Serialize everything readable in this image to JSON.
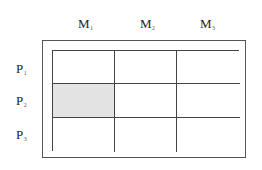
{
  "columns": [
    {
      "label": "M",
      "sub": "1"
    },
    {
      "label": "M",
      "sub": "2"
    },
    {
      "label": "M",
      "sub": "3"
    }
  ],
  "rows": [
    {
      "label": "P",
      "sub": "1"
    },
    {
      "label": "P",
      "sub": "2"
    },
    {
      "label": "P",
      "sub": "3"
    }
  ],
  "grid": {
    "shaded_cells": [
      {
        "row": 2,
        "col": 1
      }
    ],
    "shade_color": "#e3e3e3",
    "line_color": "#444444"
  }
}
